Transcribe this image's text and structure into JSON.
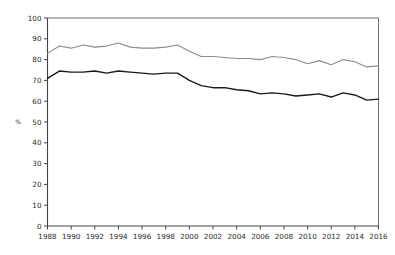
{
  "chart_data": {
    "type": "line",
    "title": "",
    "xlabel": "",
    "ylabel": "%",
    "xlim": [
      1988,
      2016
    ],
    "ylim": [
      0,
      100
    ],
    "grid": false,
    "legend_position": "none",
    "x": [
      1988,
      1989,
      1990,
      1991,
      1992,
      1993,
      1994,
      1995,
      1996,
      1997,
      1998,
      1999,
      2000,
      2001,
      2002,
      2003,
      2004,
      2005,
      2006,
      2007,
      2008,
      2009,
      2010,
      2011,
      2012,
      2013,
      2014,
      2015,
      2016
    ],
    "xticks": [
      "1988",
      "1990",
      "1992",
      "1994",
      "1996",
      "1998",
      "2000",
      "2002",
      "2004",
      "2006",
      "2008",
      "2010",
      "2012",
      "2014",
      "2016"
    ],
    "xtick_values": [
      1988,
      1990,
      1992,
      1994,
      1996,
      1998,
      2000,
      2002,
      2004,
      2006,
      2008,
      2010,
      2012,
      2014,
      2016
    ],
    "yticks": [
      "0",
      "10",
      "20",
      "30",
      "40",
      "50",
      "60",
      "70",
      "80",
      "90",
      "100"
    ],
    "ytick_values": [
      0,
      10,
      20,
      30,
      40,
      50,
      60,
      70,
      80,
      90,
      100
    ],
    "series": [
      {
        "name": "upper-series",
        "color": "#8c8c8c",
        "width": 1.1,
        "values": [
          83.0,
          86.5,
          85.5,
          87.0,
          86.0,
          86.5,
          88.0,
          86.0,
          85.5,
          85.5,
          86.0,
          87.0,
          84.0,
          81.5,
          81.5,
          81.0,
          80.5,
          80.5,
          80.0,
          81.5,
          81.0,
          80.0,
          78.0,
          79.5,
          77.5,
          80.0,
          79.0,
          76.5,
          77.0
        ]
      },
      {
        "name": "lower-series",
        "color": "#1a1a1a",
        "width": 1.4,
        "values": [
          71.0,
          74.5,
          74.0,
          74.0,
          74.5,
          73.5,
          74.5,
          74.0,
          73.5,
          73.0,
          73.5,
          73.5,
          70.0,
          67.5,
          66.5,
          66.5,
          65.5,
          65.0,
          63.5,
          64.0,
          63.5,
          62.5,
          63.0,
          63.5,
          62.0,
          64.0,
          63.0,
          60.5,
          61.0
        ]
      }
    ]
  }
}
